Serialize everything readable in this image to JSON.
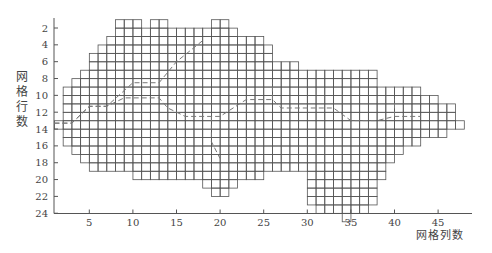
{
  "chart_data": {
    "type": "heatmap",
    "title": "",
    "xlabel": "网格列数",
    "ylabel": "网格行数",
    "xlim": [
      1,
      48
    ],
    "ylim": [
      24,
      1
    ],
    "grid": true,
    "x_ticks": [
      5,
      10,
      15,
      20,
      25,
      30,
      35,
      40,
      45
    ],
    "y_ticks": [
      2,
      4,
      6,
      8,
      10,
      12,
      14,
      16,
      18,
      20,
      22,
      24
    ],
    "columns": [
      {
        "col": 1,
        "top": 13,
        "bottom": 13
      },
      {
        "col": 2,
        "top": 9,
        "bottom": 15
      },
      {
        "col": 3,
        "top": 8,
        "bottom": 16
      },
      {
        "col": 4,
        "top": 7,
        "bottom": 17
      },
      {
        "col": 5,
        "top": 5,
        "bottom": 18
      },
      {
        "col": 6,
        "top": 4,
        "bottom": 18
      },
      {
        "col": 7,
        "top": 3,
        "bottom": 18
      },
      {
        "col": 8,
        "top": 1,
        "bottom": 18
      },
      {
        "col": 9,
        "top": 1,
        "bottom": 18
      },
      {
        "col": 10,
        "top": 1,
        "bottom": 19
      },
      {
        "col": 11,
        "top": 2,
        "bottom": 19
      },
      {
        "col": 12,
        "top": 1,
        "bottom": 19
      },
      {
        "col": 13,
        "top": 1,
        "bottom": 19
      },
      {
        "col": 14,
        "top": 2,
        "bottom": 19
      },
      {
        "col": 15,
        "top": 2,
        "bottom": 19
      },
      {
        "col": 16,
        "top": 2,
        "bottom": 19
      },
      {
        "col": 17,
        "top": 2,
        "bottom": 19
      },
      {
        "col": 18,
        "top": 2,
        "bottom": 20
      },
      {
        "col": 19,
        "top": 1,
        "bottom": 21
      },
      {
        "col": 20,
        "top": 1,
        "bottom": 21
      },
      {
        "col": 21,
        "top": 2,
        "bottom": 20
      },
      {
        "col": 22,
        "top": 3,
        "bottom": 19
      },
      {
        "col": 23,
        "top": 3,
        "bottom": 19
      },
      {
        "col": 24,
        "top": 3,
        "bottom": 19
      },
      {
        "col": 25,
        "top": 4,
        "bottom": 18
      },
      {
        "col": 26,
        "top": 6,
        "bottom": 18
      },
      {
        "col": 27,
        "top": 6,
        "bottom": 18
      },
      {
        "col": 28,
        "top": 6,
        "bottom": 18
      },
      {
        "col": 29,
        "top": 7,
        "bottom": 18
      },
      {
        "col": 30,
        "top": 7,
        "bottom": 22
      },
      {
        "col": 31,
        "top": 7,
        "bottom": 23
      },
      {
        "col": 32,
        "top": 7,
        "bottom": 23
      },
      {
        "col": 33,
        "top": 7,
        "bottom": 23
      },
      {
        "col": 34,
        "top": 7,
        "bottom": 24
      },
      {
        "col": 35,
        "top": 7,
        "bottom": 23
      },
      {
        "col": 36,
        "top": 7,
        "bottom": 23
      },
      {
        "col": 37,
        "top": 7,
        "bottom": 22
      },
      {
        "col": 38,
        "top": 9,
        "bottom": 19
      },
      {
        "col": 39,
        "top": 9,
        "bottom": 17
      },
      {
        "col": 40,
        "top": 9,
        "bottom": 16
      },
      {
        "col": 41,
        "top": 9,
        "bottom": 15
      },
      {
        "col": 42,
        "top": 9,
        "bottom": 15
      },
      {
        "col": 43,
        "top": 10,
        "bottom": 14
      },
      {
        "col": 44,
        "top": 10,
        "bottom": 14
      },
      {
        "col": 45,
        "top": 11,
        "bottom": 14
      },
      {
        "col": 46,
        "top": 11,
        "bottom": 13
      },
      {
        "col": 47,
        "top": 13,
        "bottom": 13
      }
    ],
    "paths": [
      {
        "name": "dashed-path-upper",
        "points": [
          [
            1,
            13.3
          ],
          [
            3,
            13.3
          ],
          [
            5,
            11.3
          ],
          [
            7,
            11.3
          ],
          [
            10,
            8.5
          ],
          [
            13,
            8.5
          ],
          [
            15,
            6
          ],
          [
            18,
            3.5
          ]
        ]
      },
      {
        "name": "dashed-path-main",
        "points": [
          [
            1,
            13.3
          ],
          [
            3,
            13.3
          ],
          [
            5,
            11.3
          ],
          [
            7,
            11.3
          ],
          [
            9,
            10.3
          ],
          [
            13,
            10.3
          ],
          [
            14,
            11.5
          ],
          [
            16,
            12.5
          ],
          [
            19,
            12.5
          ],
          [
            20,
            12.5
          ],
          [
            23,
            10.5
          ],
          [
            26,
            10.5
          ],
          [
            27,
            11.5
          ],
          [
            33,
            11.5
          ],
          [
            35,
            13
          ],
          [
            38,
            13
          ],
          [
            40,
            12.5
          ],
          [
            43,
            12.5
          ]
        ]
      },
      {
        "name": "dashed-path-branch-down",
        "points": [
          [
            19,
            12.5
          ],
          [
            19,
            15.5
          ],
          [
            20,
            17.5
          ]
        ]
      },
      {
        "name": "dashed-path-branch-up",
        "points": [
          [
            26,
            10.5
          ],
          [
            26,
            8.5
          ]
        ]
      },
      {
        "name": "dashed-path-branch-40",
        "points": [
          [
            40,
            12.5
          ],
          [
            40,
            10.5
          ]
        ]
      }
    ]
  }
}
